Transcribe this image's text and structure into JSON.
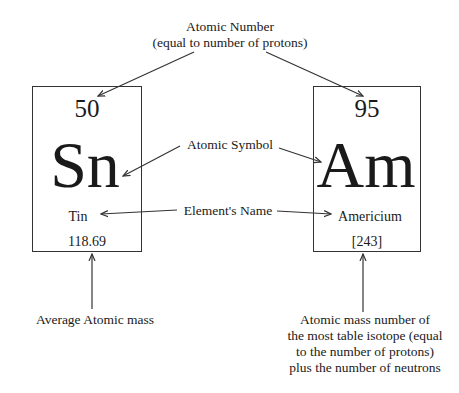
{
  "labels": {
    "atomic_number_line1": "Atomic Number",
    "atomic_number_line2": "(equal to number of protons)",
    "atomic_symbol": "Atomic Symbol",
    "element_name": "Element's Name",
    "average_mass": "Average Atomic mass",
    "mass_number_line1": "Atomic mass number of",
    "mass_number_line2": "the most table isotope (equal",
    "mass_number_line3": "to the number of protons)",
    "mass_number_line4": "plus the number of neutrons"
  },
  "elements": [
    {
      "atomic_number": "50",
      "symbol": "Sn",
      "name": "Tin",
      "mass": "118.69"
    },
    {
      "atomic_number": "95",
      "symbol": "Am",
      "name": "Americium",
      "mass": "[243]"
    }
  ],
  "colors": {
    "line": "#333333",
    "text": "#1a1a1a",
    "background": "#ffffff"
  }
}
